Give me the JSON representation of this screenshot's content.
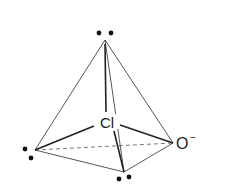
{
  "diagram": {
    "type": "molecular-geometry",
    "central_atom": {
      "label": "Cl"
    },
    "ligand": {
      "label": "O",
      "charge": "−"
    },
    "lone_pairs": [
      {
        "position": "apex"
      },
      {
        "position": "left-vertex"
      },
      {
        "position": "bottom-vertex"
      }
    ],
    "colors": {
      "line": "#333333",
      "dot": "#111111",
      "text": "#222222"
    }
  }
}
